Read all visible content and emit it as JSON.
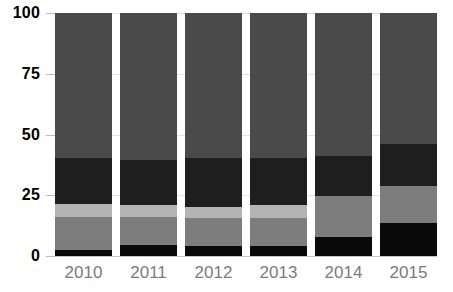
{
  "chart_data": {
    "type": "bar",
    "subtype": "stacked-bar-100-percent",
    "title": "",
    "subtitle": "",
    "xlabel": "",
    "ylabel": "",
    "categories": [
      "2010",
      "2011",
      "2012",
      "2013",
      "2014",
      "2015"
    ],
    "ylim": [
      0,
      100
    ],
    "yticks": [
      0,
      25,
      50,
      75,
      100
    ],
    "ytick_labels": [
      "0",
      "25",
      "50",
      "75",
      "100"
    ],
    "grid": true,
    "grid_axis": "y",
    "legend": false,
    "legend_position": "none",
    "stack_order": "bottom-to-top",
    "series": [
      {
        "name": "series-1",
        "color": "#0a0a0a",
        "values": [
          2.5,
          4.5,
          4.0,
          4.0,
          8.0,
          13.5
        ]
      },
      {
        "name": "series-2",
        "color": "#7d7d7d",
        "values": [
          13.5,
          11.5,
          11.5,
          11.5,
          16.5,
          15.5
        ]
      },
      {
        "name": "series-3",
        "color": "#b4b4b4",
        "values": [
          5.5,
          5.0,
          4.5,
          5.5,
          0.0,
          0.0
        ]
      },
      {
        "name": "series-4",
        "color": "#1e1e1e",
        "values": [
          19.0,
          18.5,
          20.5,
          19.5,
          16.5,
          17.0
        ]
      },
      {
        "name": "series-5",
        "color": "#4a4a4a",
        "values": [
          59.5,
          60.5,
          59.5,
          59.5,
          59.0,
          54.0
        ]
      }
    ]
  },
  "axes": {
    "y_tick_labels": [
      "100",
      "75",
      "50",
      "25",
      "0"
    ],
    "x_tick_labels": [
      "2010",
      "2011",
      "2012",
      "2013",
      "2014",
      "2015"
    ]
  },
  "colors": {
    "background": "#ffffff",
    "gridline": "#e3e3e3",
    "baseline": "#c9c9c9",
    "tick_mark": "#b9b9b9",
    "y_label_text": "#000000",
    "x_label_text": "#7b7b7b"
  }
}
